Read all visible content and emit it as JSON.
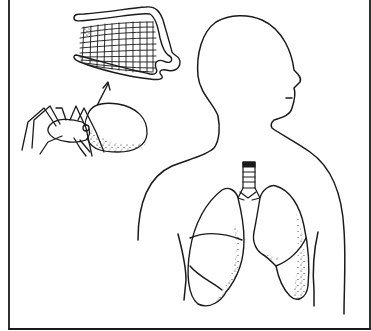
{
  "figure": {
    "style": "black line illustration on white",
    "colors": {
      "ink": "#1a1a1a",
      "background": "#ffffff"
    },
    "frame": {
      "left": 9,
      "right": 370,
      "bottom": 329,
      "top_border": false
    },
    "panels": [
      {
        "name": "book-lung-detail",
        "description": "Magnified book lung showing stacked lamellae grid"
      },
      {
        "name": "spider",
        "description": "Spider in side view with stippled abdomen"
      },
      {
        "name": "arrow",
        "description": "Arrow from spider abdomen up to book lung detail"
      },
      {
        "name": "human-silhouette",
        "description": "Outline of human head and torso facing right"
      },
      {
        "name": "human-lungs",
        "description": "Trachea with rings and two lungs with lobes, stippled shading"
      }
    ]
  }
}
